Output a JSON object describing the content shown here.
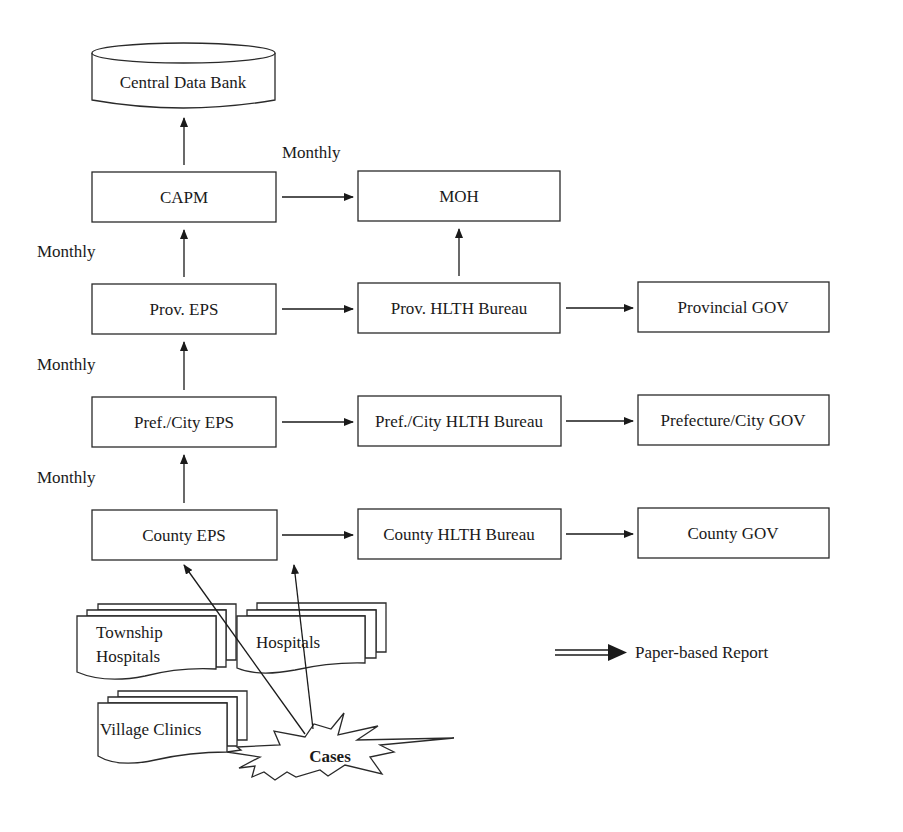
{
  "diagram": {
    "nodes": {
      "central_data_bank": "Central Data Bank",
      "capm": "CAPM",
      "moh": "MOH",
      "prov_eps": "Prov. EPS",
      "prov_hlth": "Prov. HLTH Bureau",
      "provincial_gov": "Provincial GOV",
      "pref_eps": "Pref./City EPS",
      "pref_hlth": "Pref./City HLTH Bureau",
      "pref_gov": "Prefecture/City GOV",
      "county_eps": "County EPS",
      "county_hlth": "County HLTH Bureau",
      "county_gov": "County GOV",
      "township_line1": "Township",
      "township_line2": "Hospitals",
      "hospitals": "Hospitals",
      "village_clinics": "Village Clinics",
      "cases": "Cases"
    },
    "edge_labels": {
      "capm_to_moh": "Monthly",
      "prov_to_capm": "Monthly",
      "pref_to_prov": "Monthly",
      "county_to_pref": "Monthly"
    },
    "legend": {
      "paper_report": "Paper-based Report"
    },
    "edges": [
      {
        "from": "capm",
        "to": "central_data_bank"
      },
      {
        "from": "capm",
        "to": "moh"
      },
      {
        "from": "prov_eps",
        "to": "capm"
      },
      {
        "from": "prov_eps",
        "to": "prov_hlth"
      },
      {
        "from": "prov_hlth",
        "to": "moh"
      },
      {
        "from": "prov_hlth",
        "to": "provincial_gov"
      },
      {
        "from": "pref_eps",
        "to": "prov_eps"
      },
      {
        "from": "pref_eps",
        "to": "pref_hlth"
      },
      {
        "from": "pref_hlth",
        "to": "pref_gov"
      },
      {
        "from": "county_eps",
        "to": "pref_eps"
      },
      {
        "from": "county_eps",
        "to": "county_hlth"
      },
      {
        "from": "county_hlth",
        "to": "county_gov"
      },
      {
        "from": "cases",
        "to": "county_eps"
      },
      {
        "from": "cases",
        "to": "county_eps"
      }
    ]
  }
}
